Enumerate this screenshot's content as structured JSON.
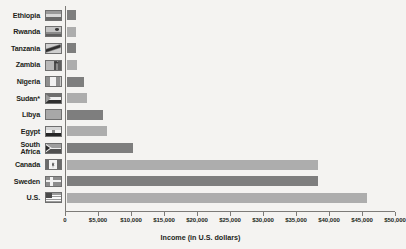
{
  "chart_data": {
    "type": "bar",
    "orientation": "horizontal",
    "title": "",
    "xlabel": "Income (in U.S. dollars)",
    "ylabel": "",
    "xlim": [
      0,
      50000
    ],
    "grid": false,
    "legend": "none",
    "tick_labels": [
      "0",
      "$5,000",
      "$10,000",
      "$15,000",
      "$20,000",
      "$25,000",
      "$30,000",
      "$35,000",
      "$40,000",
      "$45,000",
      "$50,000"
    ],
    "tick_values": [
      0,
      5000,
      10000,
      15000,
      20000,
      25000,
      30000,
      35000,
      40000,
      45000,
      50000
    ],
    "categories": [
      "Ethiopia",
      "Rwanda",
      "Tanzania",
      "Zambia",
      "Nigeria",
      "Sudan*",
      "Libya",
      "Egypt",
      "South Africa",
      "Canada",
      "Sweden",
      "U.S."
    ],
    "values": [
      1300,
      1300,
      1400,
      1500,
      2500,
      3000,
      5500,
      6000,
      10000,
      38000,
      38000,
      45500
    ],
    "bar_colors": [
      "#7e7e7e",
      "#adadad",
      "#7e7e7e",
      "#adadad",
      "#7e7e7e",
      "#adadad",
      "#7e7e7e",
      "#adadad",
      "#7e7e7e",
      "#adadad",
      "#7e7e7e",
      "#adadad"
    ],
    "footnote_marker": "*"
  },
  "rows": [
    {
      "label": "Ethiopia",
      "flag": "flag-ethiopia",
      "value": 1300
    },
    {
      "label": "Rwanda",
      "flag": "flag-rwanda",
      "value": 1300
    },
    {
      "label": "Tanzania",
      "flag": "flag-tanzania",
      "value": 1400
    },
    {
      "label": "Zambia",
      "flag": "flag-zambia",
      "value": 1500
    },
    {
      "label": "Nigeria",
      "flag": "flag-nigeria",
      "value": 2500
    },
    {
      "label": "Sudan*",
      "flag": "flag-sudan",
      "value": 3000
    },
    {
      "label": "Libya",
      "flag": "flag-libya",
      "value": 5500
    },
    {
      "label": "Egypt",
      "flag": "flag-egypt",
      "value": 6000
    },
    {
      "label": "South\nAfrica",
      "flag": "flag-south-africa",
      "value": 10000
    },
    {
      "label": "Canada",
      "flag": "flag-canada",
      "value": 38000
    },
    {
      "label": "Sweden",
      "flag": "flag-sweden",
      "value": 38000
    },
    {
      "label": "U.S.",
      "flag": "flag-united-states",
      "value": 45500
    }
  ],
  "axis": {
    "x_title": "Income (in U.S. dollars)"
  },
  "colors": {
    "background": "#f4f3f1",
    "bar_dark": "#7e7e7e",
    "bar_light": "#adadad",
    "axis": "#7d7b78",
    "text": "#231f20"
  }
}
